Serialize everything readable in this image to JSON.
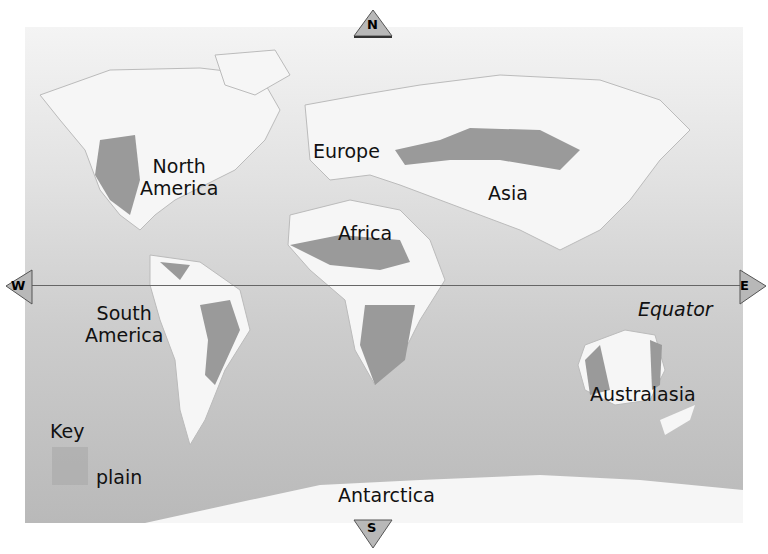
{
  "map": {
    "title": "World map showing plains",
    "continents": [
      {
        "name": "North America",
        "line1": "North",
        "line2": "America"
      },
      {
        "name": "Europe"
      },
      {
        "name": "Asia"
      },
      {
        "name": "Africa"
      },
      {
        "name": "South America",
        "line1": "South",
        "line2": "America"
      },
      {
        "name": "Australasia"
      },
      {
        "name": "Antarctica"
      }
    ],
    "equator_label": "Equator",
    "compass": {
      "north": "N",
      "south": "S",
      "east": "E",
      "west": "W"
    },
    "key": {
      "title": "Key",
      "items": [
        {
          "label": "plain",
          "color": "#a9a9a9"
        }
      ]
    },
    "colors": {
      "ocean_top": "#f4f4f4",
      "ocean_bottom": "#b9b9b9",
      "land": "#f7f7f7",
      "plain": "#999999"
    }
  }
}
